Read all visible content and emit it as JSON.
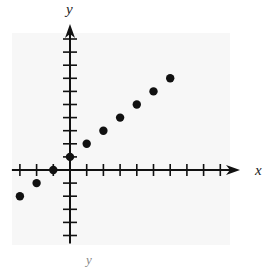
{
  "chart_data": {
    "type": "scatter",
    "title": "",
    "xlabel": "x",
    "ylabel": "y",
    "footer_label": "y",
    "xlim": [
      -3,
      9
    ],
    "ylim": [
      -5,
      10
    ],
    "grid": false,
    "legend": null,
    "x_ticks": [
      -3,
      -2,
      -1,
      0,
      1,
      2,
      3,
      4,
      5,
      6,
      7,
      8,
      9
    ],
    "y_ticks": [
      -5,
      -4,
      -3,
      -2,
      -1,
      0,
      1,
      2,
      3,
      4,
      5,
      6,
      7,
      8,
      9,
      10
    ],
    "tick_labels_shown": false,
    "series": [
      {
        "name": "points",
        "x": [
          -3,
          -2,
          -1,
          0,
          1,
          2,
          3,
          4,
          5,
          6
        ],
        "y": [
          -2,
          -1,
          0,
          1,
          2,
          3,
          4,
          5,
          6,
          7
        ]
      }
    ]
  },
  "colors": {
    "background_panel": "#f7f7f7",
    "axis": "#111111",
    "points": "#111111"
  }
}
